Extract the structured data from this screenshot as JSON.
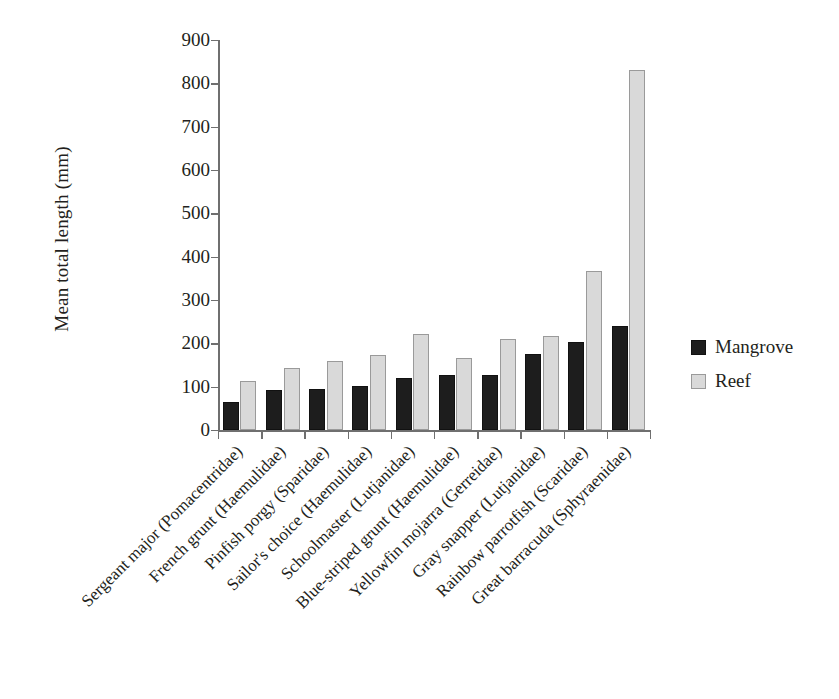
{
  "chart_data": {
    "type": "bar",
    "title": "",
    "xlabel": "",
    "ylabel": "Mean total length (mm)",
    "ylim": [
      0,
      900
    ],
    "yticks": [
      0,
      100,
      200,
      300,
      400,
      500,
      600,
      700,
      800,
      900
    ],
    "grid": false,
    "legend_position": "right",
    "categories": [
      "Sergeant major (Pomacentridae)",
      "French grunt (Haemulidae)",
      "Pinfish porgy (Sparidae)",
      "Sailor's choice (Haemulidae)",
      "Schoolmaster (Lutjanidae)",
      "Blue-striped grunt (Haemulidae)",
      "Yellowfin mojarra (Gerreidae)",
      "Gray snapper (Lutjanidae)",
      "Rainbow parrotfish (Scaridae)",
      "Great barracuda (Sphyraenidae)"
    ],
    "series": [
      {
        "name": "Mangrove",
        "color": "#1d1d1d",
        "values": [
          65,
          92,
          95,
          102,
          120,
          127,
          126,
          176,
          202,
          240
        ]
      },
      {
        "name": "Reef",
        "color": "#d9d9d9",
        "values": [
          112,
          142,
          160,
          172,
          222,
          167,
          210,
          216,
          367,
          830
        ]
      }
    ]
  },
  "legend": {
    "items": [
      {
        "label": "Mangrove",
        "swatch": "mangrove"
      },
      {
        "label": "Reef",
        "swatch": "reef"
      }
    ]
  }
}
